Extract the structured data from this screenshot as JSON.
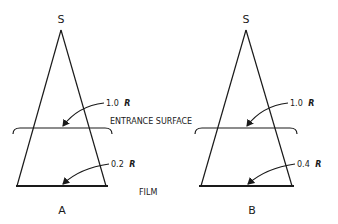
{
  "diagram": {
    "source_label": "S",
    "shared_labels": {
      "entrance_surface": "ENTRANCE SURFACE",
      "film": "FILM"
    },
    "panels": [
      {
        "id": "A",
        "caption": "A",
        "source": "S",
        "entrance_value": "1.0",
        "entrance_unit": "R",
        "film_value": "0.2",
        "film_unit": "R"
      },
      {
        "id": "B",
        "caption": "B",
        "source": "S",
        "entrance_value": "1.0",
        "entrance_unit": "R",
        "film_value": "0.4",
        "film_unit": "R"
      }
    ],
    "colors": {
      "ink": "#1a1a1a",
      "background": "#ffffff"
    }
  }
}
